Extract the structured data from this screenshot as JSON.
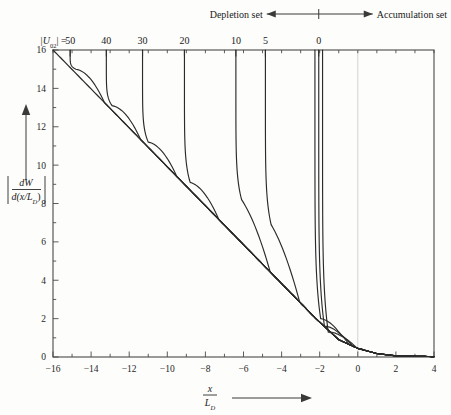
{
  "annotations": {
    "depletion_label": "Depletion set",
    "accumulation_label": "Accumulation set",
    "param_prefix": "|U",
    "param_sub": "02",
    "param_suffix": "| =",
    "ylabel_num": "dW",
    "ylabel_den_a": "d(x/L",
    "ylabel_den_sub": "D",
    "ylabel_den_b": ")",
    "xlabel_num": "x",
    "xlabel_den": "L",
    "xlabel_den_sub": "D"
  },
  "chart_data": {
    "type": "line",
    "title": "",
    "xlabel": "x/L_D",
    "ylabel": "|dW/d(x/L_D)|",
    "xlim": [
      -16,
      4
    ],
    "ylim": [
      0,
      16
    ],
    "xticks": [
      -16,
      -14,
      -12,
      -10,
      -8,
      -6,
      -4,
      -2,
      0,
      2,
      4
    ],
    "xtick_labels": [
      "-16",
      "-14",
      "-12",
      "-10",
      "-8",
      "-6",
      "-4",
      "-2",
      "0",
      "2",
      "4"
    ],
    "yticks": [
      0,
      2,
      4,
      6,
      8,
      10,
      12,
      14,
      16
    ],
    "ytick_labels": [
      "0",
      "2",
      "4",
      "6",
      "8",
      "10",
      "12",
      "14",
      "16"
    ],
    "xminor_step": 1,
    "yminor_step": 1,
    "grid": false,
    "zero_line_x": 0,
    "legend_position": "top-axis",
    "top_axis_label": "|U02| =",
    "top_axis_ticks": [
      50,
      40,
      30,
      20,
      10,
      5,
      0
    ],
    "top_axis_tick_x": [
      -15.1,
      -13.2,
      -11.3,
      -9.1,
      -6.4,
      -4.85,
      -2.05
    ],
    "series": [
      {
        "name": "50",
        "U02": 50,
        "asymptote_x": -15.1,
        "knee_y": 15.0
      },
      {
        "name": "40",
        "U02": 40,
        "asymptote_x": -13.2,
        "knee_y": 13.1
      },
      {
        "name": "30",
        "U02": 30,
        "asymptote_x": -11.3,
        "knee_y": 11.2
      },
      {
        "name": "20",
        "U02": 20,
        "asymptote_x": -9.1,
        "knee_y": 9.1
      },
      {
        "name": "10",
        "U02": 10,
        "asymptote_x": -6.4,
        "knee_y": 8.2
      },
      {
        "name": "5",
        "U02": 5,
        "asymptote_x": -4.85,
        "knee_y": 6.9
      },
      {
        "name": "0a",
        "U02": 0,
        "asymptote_x": -2.25,
        "knee_y": 2.0
      },
      {
        "name": "0b",
        "U02": 0,
        "asymptote_x": -2.05,
        "knee_y": 1.6
      },
      {
        "name": "0c",
        "U02": 0,
        "asymptote_x": -1.85,
        "knee_y": 1.3
      }
    ],
    "envelope": {
      "name": "envelope",
      "points": [
        [
          -16,
          16
        ],
        [
          -2.2,
          2.0
        ],
        [
          -1.0,
          0.9
        ],
        [
          0,
          0.45
        ],
        [
          1.0,
          0.18
        ],
        [
          2.0,
          0.06
        ],
        [
          4,
          0.02
        ]
      ]
    }
  }
}
